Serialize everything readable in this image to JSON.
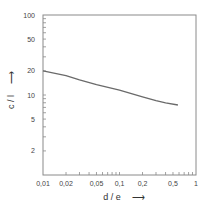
{
  "chart_data": {
    "type": "line",
    "title": "",
    "xlabel": "d / e",
    "ylabel": "c / l",
    "xscale": "log",
    "yscale": "log",
    "xlim": [
      0.01,
      1
    ],
    "ylim": [
      1,
      100
    ],
    "grid": false,
    "legend": null,
    "x_ticks": [
      {
        "value": 0.01,
        "label": "0,01"
      },
      {
        "value": 0.02,
        "label": "0,02"
      },
      {
        "value": 0.05,
        "label": "0,05"
      },
      {
        "value": 0.1,
        "label": "0,1"
      },
      {
        "value": 0.2,
        "label": "0,2"
      },
      {
        "value": 0.5,
        "label": "0,5"
      },
      {
        "value": 1,
        "label": "1"
      }
    ],
    "y_ticks": [
      {
        "value": 2,
        "label": "2"
      },
      {
        "value": 5,
        "label": "5"
      },
      {
        "value": 10,
        "label": "10"
      },
      {
        "value": 20,
        "label": "20"
      },
      {
        "value": 50,
        "label": "50"
      },
      {
        "value": 100,
        "label": "100"
      }
    ],
    "series": [
      {
        "name": "c/l vs d/e",
        "x": [
          0.01,
          0.02,
          0.03,
          0.05,
          0.1,
          0.2,
          0.3,
          0.4,
          0.58
        ],
        "y": [
          20,
          17.5,
          15.5,
          13.5,
          11.5,
          9.5,
          8.5,
          8.0,
          7.5
        ]
      }
    ]
  },
  "labels": {
    "x_axis_title": "d / e",
    "y_axis_title": "c / l",
    "x_arrow": "⟶",
    "y_arrow": "⟶"
  }
}
